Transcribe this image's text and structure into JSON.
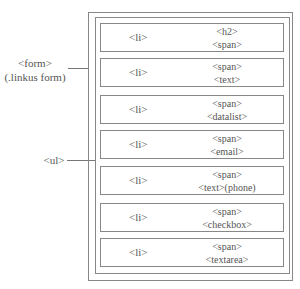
{
  "annotations": {
    "form": {
      "line1": "<form>",
      "line2": "(.linkus form)"
    },
    "ul": {
      "label": "<ul>"
    }
  },
  "list_items": [
    {
      "tag": "<li>",
      "line1": "<h2>",
      "line2": "<span>"
    },
    {
      "tag": "<li>",
      "line1": "<span>",
      "line2": "<text>"
    },
    {
      "tag": "<li>",
      "line1": "<span>",
      "line2": "<datalist>"
    },
    {
      "tag": "<li>",
      "line1": "<span>",
      "line2": "<email>"
    },
    {
      "tag": "<li>",
      "line1": "<span>",
      "line2": "<text>(phone)"
    },
    {
      "tag": "<li>",
      "line1": "<span>",
      "line2": "<checkbox>"
    },
    {
      "tag": "<li>",
      "line1": "<span>",
      "line2": "<textarea>"
    }
  ]
}
